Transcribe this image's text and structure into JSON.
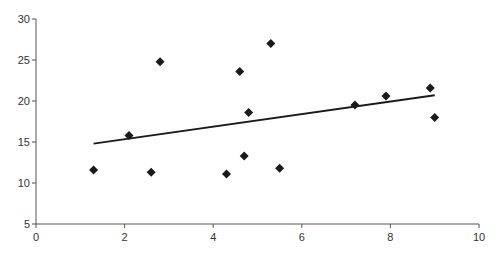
{
  "chart_data": {
    "type": "scatter",
    "title": "",
    "xlabel": "",
    "ylabel": "",
    "xlim": [
      0,
      10
    ],
    "ylim": [
      5,
      30
    ],
    "x_ticks": [
      0,
      2,
      4,
      6,
      8,
      10
    ],
    "y_ticks": [
      5,
      10,
      15,
      20,
      25,
      30
    ],
    "grid": false,
    "legend": null,
    "marker": "diamond",
    "series": [
      {
        "name": "points",
        "points": [
          {
            "x": 1.3,
            "y": 11.6
          },
          {
            "x": 2.1,
            "y": 15.8
          },
          {
            "x": 2.6,
            "y": 11.3
          },
          {
            "x": 2.8,
            "y": 24.8
          },
          {
            "x": 4.3,
            "y": 11.1
          },
          {
            "x": 4.6,
            "y": 23.6
          },
          {
            "x": 4.7,
            "y": 13.3
          },
          {
            "x": 4.8,
            "y": 18.6
          },
          {
            "x": 5.3,
            "y": 27.0
          },
          {
            "x": 5.5,
            "y": 11.8
          },
          {
            "x": 7.2,
            "y": 19.5
          },
          {
            "x": 7.9,
            "y": 20.6
          },
          {
            "x": 8.9,
            "y": 21.6
          },
          {
            "x": 9.0,
            "y": 18.0
          }
        ]
      }
    ],
    "trendline": {
      "x1": 1.3,
      "y1": 14.8,
      "x2": 9.0,
      "y2": 20.7
    },
    "colors": {
      "marker": "#1a1a1a",
      "line": "#1a1a1a",
      "axis": "#555555"
    }
  }
}
